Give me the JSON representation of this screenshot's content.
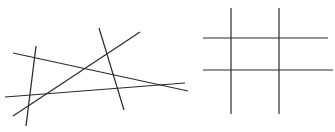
{
  "caption": "",
  "figures": [
    {
      "name": "intersecting-lines",
      "lines": [
        {
          "x1": 36,
          "y1": 46,
          "x2": 26,
          "y2": 126
        },
        {
          "x1": 13,
          "y1": 53,
          "x2": 188,
          "y2": 91
        },
        {
          "x1": 5,
          "y1": 97,
          "x2": 185,
          "y2": 83
        },
        {
          "x1": 13,
          "y1": 116,
          "x2": 140,
          "y2": 32
        },
        {
          "x1": 99,
          "y1": 28,
          "x2": 124,
          "y2": 110
        }
      ]
    },
    {
      "name": "grid-lines",
      "lines": [
        {
          "x1": 231,
          "y1": 8,
          "x2": 231,
          "y2": 114
        },
        {
          "x1": 279,
          "y1": 8,
          "x2": 279,
          "y2": 114
        },
        {
          "x1": 203,
          "y1": 38,
          "x2": 328,
          "y2": 38
        },
        {
          "x1": 203,
          "y1": 70,
          "x2": 333,
          "y2": 70
        }
      ]
    }
  ],
  "stroke_color": "#2a2a2a"
}
